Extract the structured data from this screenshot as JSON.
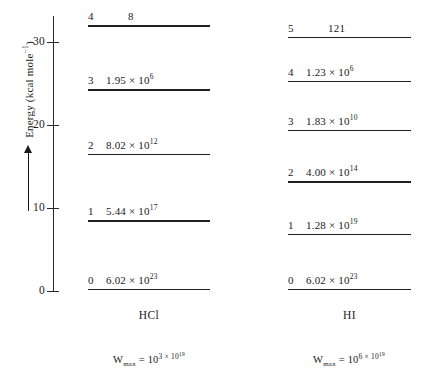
{
  "chart_data": {
    "type": "diagram",
    "title": "",
    "ylabel": "Energy (kcal mole",
    "ylabel_exp": "−1",
    "ylabel_close": ")",
    "ylim": [
      0,
      34
    ],
    "yticks": [
      "0",
      "10",
      "20",
      "30"
    ],
    "ytick_values": [
      0,
      10,
      20,
      30
    ],
    "grid": false,
    "axis_arrow_direction": "up",
    "columns": [
      {
        "name": "HCl",
        "label": "HCl",
        "wmax_prefix": "W",
        "wmax_sub": "max",
        "wmax_eq": " = 10",
        "wmax_exp_mantissa": "3 × 10",
        "wmax_exp_exponent": "19",
        "wmax_full": "W_max = 10^(3 × 10^19)",
        "levels": [
          {
            "index": "4",
            "value": "8",
            "mantissa": "8",
            "exponent": "",
            "energy": 32.0,
            "centered": true
          },
          {
            "index": "3",
            "value": "1.95 × 10⁶",
            "mantissa": "1.95 × 10",
            "exponent": "6",
            "energy": 24.3,
            "centered": false
          },
          {
            "index": "2",
            "value": "8.02 × 10¹²",
            "mantissa": "8.02 × 10",
            "exponent": "12",
            "energy": 16.5,
            "centered": false
          },
          {
            "index": "1",
            "value": "5.44 × 10¹⁷",
            "mantissa": "5.44 × 10",
            "exponent": "17",
            "energy": 8.5,
            "centered": false
          },
          {
            "index": "0",
            "value": "6.02 × 10²³",
            "mantissa": "6.02 × 10",
            "exponent": "23",
            "energy": 0.3,
            "centered": false
          }
        ]
      },
      {
        "name": "HI",
        "label": "HI",
        "wmax_prefix": "W",
        "wmax_sub": "max",
        "wmax_eq": " = 10",
        "wmax_exp_mantissa": "6 × 10",
        "wmax_exp_exponent": "19",
        "wmax_full": "W_max = 10^(6 × 10^19)",
        "levels": [
          {
            "index": "5",
            "value": "121",
            "mantissa": "121",
            "exponent": "",
            "energy": 30.6,
            "centered": true
          },
          {
            "index": "4",
            "value": "1.23 × 10⁶",
            "mantissa": "1.23 × 10",
            "exponent": "6",
            "energy": 25.3,
            "centered": false
          },
          {
            "index": "3",
            "value": "1.83 × 10¹⁰",
            "mantissa": "1.83 × 10",
            "exponent": "10",
            "energy": 19.4,
            "centered": false
          },
          {
            "index": "2",
            "value": "4.00 × 10¹⁴",
            "mantissa": "4.00 × 10",
            "exponent": "14",
            "energy": 13.2,
            "centered": false
          },
          {
            "index": "1",
            "value": "1.28 × 10¹⁹",
            "mantissa": "1.28 × 10",
            "exponent": "19",
            "energy": 6.9,
            "centered": false
          },
          {
            "index": "0",
            "value": "6.02 × 10²³",
            "mantissa": "6.02 × 10",
            "exponent": "23",
            "energy": 0.3,
            "centered": false
          }
        ]
      }
    ]
  }
}
